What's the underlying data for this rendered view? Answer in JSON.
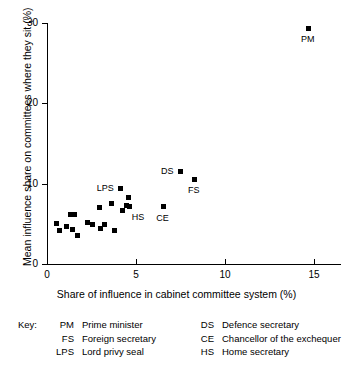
{
  "chart_data": {
    "type": "scatter",
    "title": "",
    "xlabel": "Share of influence in cabinet committee system (%)",
    "ylabel": "Mean influence share on committees where they sit (%)",
    "xlim": [
      0,
      16.5
    ],
    "ylim": [
      0,
      30
    ],
    "xticks": [
      0,
      5,
      10,
      15
    ],
    "yticks": [
      0,
      10,
      20,
      30
    ],
    "xtick_labels": [
      "0",
      "5",
      "10",
      "15"
    ],
    "ytick_labels": [
      "0",
      "10",
      "20",
      "30"
    ],
    "grid": false,
    "legend_position": "below-plot",
    "marker": "filled-square",
    "marker_color": "#000000",
    "points": [
      {
        "id": "p01",
        "x": 0.55,
        "y": 5.0,
        "label": ""
      },
      {
        "id": "p02",
        "x": 0.7,
        "y": 4.2,
        "label": ""
      },
      {
        "id": "p03",
        "x": 1.1,
        "y": 4.6,
        "label": ""
      },
      {
        "id": "p04",
        "x": 1.3,
        "y": 6.1,
        "label": ""
      },
      {
        "id": "p05",
        "x": 1.55,
        "y": 6.1,
        "label": ""
      },
      {
        "id": "p06",
        "x": 1.45,
        "y": 4.3,
        "label": ""
      },
      {
        "id": "p07",
        "x": 1.7,
        "y": 3.6,
        "label": ""
      },
      {
        "id": "p08",
        "x": 2.3,
        "y": 5.2,
        "label": ""
      },
      {
        "id": "p09",
        "x": 2.55,
        "y": 4.9,
        "label": ""
      },
      {
        "id": "p10",
        "x": 2.95,
        "y": 7.0,
        "label": ""
      },
      {
        "id": "p11",
        "x": 3.0,
        "y": 4.4,
        "label": ""
      },
      {
        "id": "p12",
        "x": 3.25,
        "y": 4.9,
        "label": ""
      },
      {
        "id": "p13",
        "x": 3.6,
        "y": 7.5,
        "label": ""
      },
      {
        "id": "p14",
        "x": 3.8,
        "y": 4.1,
        "label": ""
      },
      {
        "id": "p15",
        "x": 4.15,
        "y": 9.4,
        "label": "LPS"
      },
      {
        "id": "p16",
        "x": 4.25,
        "y": 6.6,
        "label": ""
      },
      {
        "id": "p17",
        "x": 4.45,
        "y": 7.3,
        "label": ""
      },
      {
        "id": "p18",
        "x": 4.6,
        "y": 8.2,
        "label": ""
      },
      {
        "id": "p19",
        "x": 4.65,
        "y": 7.2,
        "label": "HS"
      },
      {
        "id": "p20",
        "x": 6.55,
        "y": 7.1,
        "label": "CE"
      },
      {
        "id": "p21",
        "x": 7.5,
        "y": 11.5,
        "label": "DS"
      },
      {
        "id": "p22",
        "x": 8.3,
        "y": 10.5,
        "label": "FS"
      },
      {
        "id": "p23",
        "x": 14.7,
        "y": 29.3,
        "label": "PM"
      }
    ],
    "annotations": [
      {
        "text": "PM",
        "for": "p23",
        "placement": "below"
      },
      {
        "text": "FS",
        "for": "p22",
        "placement": "below"
      },
      {
        "text": "DS",
        "for": "p21",
        "placement": "left"
      },
      {
        "text": "CE",
        "for": "p20",
        "placement": "below"
      },
      {
        "text": "LPS",
        "for": "p15",
        "placement": "left"
      },
      {
        "text": "HS",
        "for": "p19",
        "placement": "below-right"
      }
    ]
  },
  "key": {
    "title": "Key:",
    "columns": [
      {
        "entries": [
          {
            "abbr": "PM",
            "desc": "Prime minister"
          },
          {
            "abbr": "FS",
            "desc": "Foreign secretary"
          },
          {
            "abbr": "LPS",
            "desc": "Lord privy seal"
          }
        ]
      },
      {
        "entries": [
          {
            "abbr": "DS",
            "desc": "Defence secretary"
          },
          {
            "abbr": "CE",
            "desc": "Chancellor of the exchequer"
          },
          {
            "abbr": "HS",
            "desc": "Home secretary"
          }
        ]
      }
    ]
  }
}
